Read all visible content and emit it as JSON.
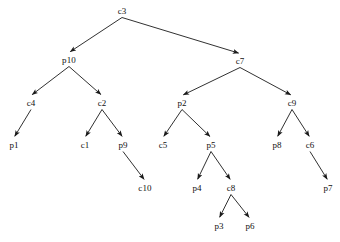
{
  "diagram": {
    "type": "directed-tree",
    "title": "",
    "background_color": "#ffffff",
    "edge_color": "#1a1a1a",
    "label_color": "#111111",
    "canvas": {
      "width": 340,
      "height": 242
    },
    "nodes": [
      {
        "id": "c3",
        "label": "c3",
        "x": 122,
        "y": 11,
        "level": 0
      },
      {
        "id": "p10",
        "label": "p10",
        "x": 69,
        "y": 60,
        "level": 1
      },
      {
        "id": "c7",
        "label": "c7",
        "x": 240,
        "y": 61,
        "level": 1
      },
      {
        "id": "c4",
        "label": "c4",
        "x": 31,
        "y": 103,
        "level": 2
      },
      {
        "id": "c2",
        "label": "c2",
        "x": 102,
        "y": 103,
        "level": 2
      },
      {
        "id": "p2",
        "label": "p2",
        "x": 182,
        "y": 103,
        "level": 2
      },
      {
        "id": "c9",
        "label": "c9",
        "x": 292,
        "y": 103,
        "level": 2
      },
      {
        "id": "p1",
        "label": "p1",
        "x": 14,
        "y": 145,
        "level": 3
      },
      {
        "id": "c1",
        "label": "c1",
        "x": 85,
        "y": 145,
        "level": 3
      },
      {
        "id": "p9",
        "label": "p9",
        "x": 123,
        "y": 145,
        "level": 3
      },
      {
        "id": "c5",
        "label": "c5",
        "x": 163,
        "y": 145,
        "level": 3
      },
      {
        "id": "p5",
        "label": "p5",
        "x": 211,
        "y": 145,
        "level": 3
      },
      {
        "id": "p8",
        "label": "p8",
        "x": 277,
        "y": 145,
        "level": 3
      },
      {
        "id": "c6",
        "label": "c6",
        "x": 310,
        "y": 145,
        "level": 3
      },
      {
        "id": "c10",
        "label": "c10",
        "x": 145,
        "y": 188,
        "level": 4
      },
      {
        "id": "p4",
        "label": "p4",
        "x": 197,
        "y": 188,
        "level": 4
      },
      {
        "id": "c8",
        "label": "c8",
        "x": 231,
        "y": 188,
        "level": 4
      },
      {
        "id": "p7",
        "label": "p7",
        "x": 328,
        "y": 188,
        "level": 4
      },
      {
        "id": "p3",
        "label": "p3",
        "x": 219,
        "y": 226,
        "level": 5
      },
      {
        "id": "p6",
        "label": "p6",
        "x": 250,
        "y": 226,
        "level": 5
      }
    ],
    "edges": [
      {
        "from": "c3",
        "to": "p10"
      },
      {
        "from": "c3",
        "to": "c7"
      },
      {
        "from": "p10",
        "to": "c4"
      },
      {
        "from": "p10",
        "to": "c2"
      },
      {
        "from": "c4",
        "to": "p1"
      },
      {
        "from": "c2",
        "to": "c1"
      },
      {
        "from": "c2",
        "to": "p9"
      },
      {
        "from": "p9",
        "to": "c10"
      },
      {
        "from": "c7",
        "to": "p2"
      },
      {
        "from": "c7",
        "to": "c9"
      },
      {
        "from": "p2",
        "to": "c5"
      },
      {
        "from": "p2",
        "to": "p5"
      },
      {
        "from": "p5",
        "to": "p4"
      },
      {
        "from": "p5",
        "to": "c8"
      },
      {
        "from": "c8",
        "to": "p3"
      },
      {
        "from": "c8",
        "to": "p6"
      },
      {
        "from": "c9",
        "to": "p8"
      },
      {
        "from": "c9",
        "to": "c6"
      },
      {
        "from": "c6",
        "to": "p7"
      }
    ]
  }
}
